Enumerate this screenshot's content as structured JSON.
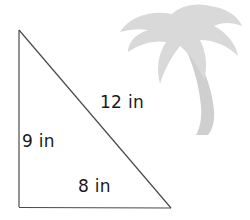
{
  "diagram": {
    "shape": "triangle",
    "vertices": {
      "top": [
        19,
        30
      ],
      "bottom_left": [
        19,
        207
      ],
      "bottom_right": [
        171,
        208
      ]
    },
    "sides": [
      {
        "name": "hypotenuse",
        "label": "12 in",
        "length": 12,
        "unit": "in"
      },
      {
        "name": "left",
        "label": "9 in",
        "length": 9,
        "unit": "in"
      },
      {
        "name": "bottom",
        "label": "8 in",
        "length": 8,
        "unit": "in"
      }
    ],
    "decoration": {
      "icon": "palm-tree-icon",
      "color": "#d9d9d9"
    },
    "colors": {
      "line": "#4a4a4a",
      "text": "#1a1a1a",
      "background": "#ffffff"
    }
  }
}
